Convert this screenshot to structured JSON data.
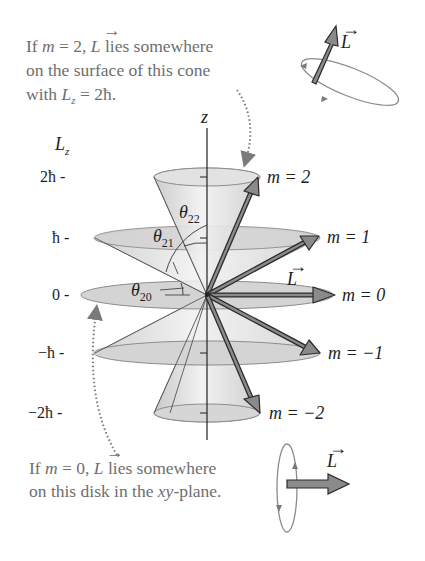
{
  "figure": {
    "top_caption": {
      "line1_prefix": "If ",
      "line1_m": "m",
      "line1_eq": " = 2, ",
      "line1_L": "L",
      "line1_suffix": " lies somewhere",
      "line2": "on the surface of this cone",
      "line3_prefix": "with ",
      "line3_L": "L",
      "line3_sub": "z",
      "line3_suffix": " = 2ħ."
    },
    "bottom_caption": {
      "line1_prefix": "If ",
      "line1_m": "m",
      "line1_eq": " = 0, ",
      "line1_L": "L",
      "line1_suffix": " lies somewhere",
      "line2_prefix": "on this disk in the ",
      "line2_xy": "xy",
      "line2_suffix": "-plane."
    },
    "axis": {
      "z_label": "z",
      "lz_label": "L",
      "lz_sub": "z",
      "ticks": [
        "2ħ -",
        "ħ -",
        "0 -",
        "−ħ -",
        "−2ħ -"
      ]
    },
    "m_labels": [
      "m = 2",
      "m = 1",
      "m = 0",
      "m = −1",
      "m = −2"
    ],
    "angles": {
      "theta22": {
        "sym": "θ",
        "sub": "22"
      },
      "theta21": {
        "sym": "θ",
        "sub": "21"
      },
      "theta20": {
        "sym": "θ",
        "sub": "20"
      }
    },
    "vector_label": "L",
    "colors": {
      "arrow_fill": "#8a8a8a",
      "arrow_stroke": "#2a2a2a",
      "disk_fill": "#d4d4d4",
      "disk_stroke": "#8c8c8c",
      "caption_text": "#6e6e6e",
      "dotted": "#7a7a7a"
    }
  }
}
